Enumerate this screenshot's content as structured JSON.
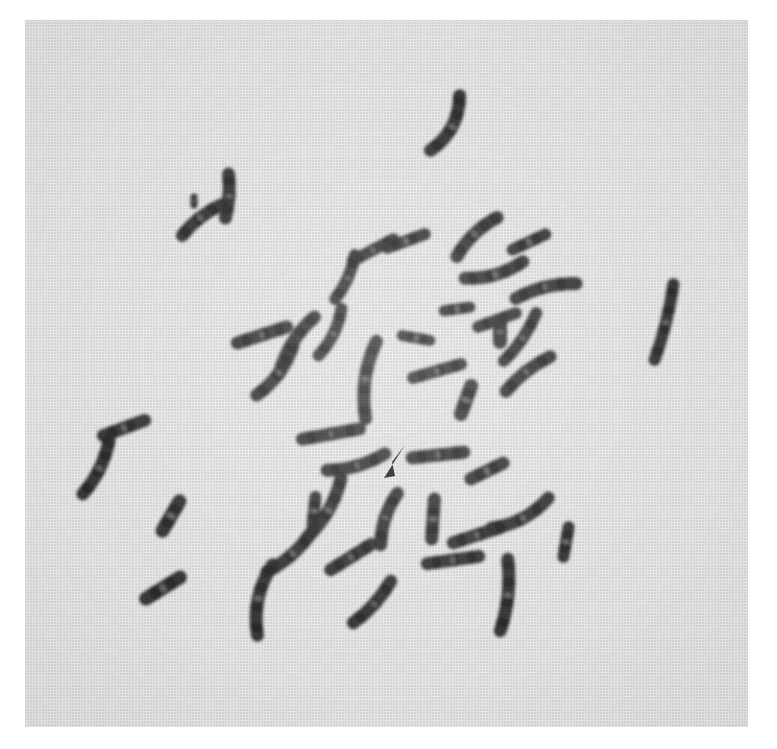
{
  "figure": {
    "kind": "photomicrograph",
    "caption_text": "",
    "plate_background_color": "#e4e4e4",
    "stain_color": "#1a1a1a",
    "page_background_color": "#ffffff",
    "has_visible_text": false,
    "plate": {
      "x": 25,
      "y": 20,
      "width": 723,
      "height": 707
    },
    "annotation": {
      "marker_type": "arrowhead",
      "marker_color": "#0d0d0d",
      "label": "",
      "points_toward": "up-right",
      "position": {
        "x": 383,
        "y": 444,
        "width": 24,
        "height": 36
      },
      "polygon": "405,445 384,478 395,476 392,462"
    },
    "chromosome_count_visible": 46,
    "chromosomes": [
      {
        "id": "c01",
        "cx": 445,
        "cy": 123,
        "len": 62,
        "w": 13,
        "rot": 28,
        "bend": 16,
        "bands": [
          0.12,
          0.42,
          0.7,
          0.92
        ]
      },
      {
        "id": "c02",
        "cx": 227,
        "cy": 196,
        "len": 44,
        "w": 13,
        "rot": 4,
        "bend": 4,
        "bands": [
          0.18,
          0.52,
          0.84
        ]
      },
      {
        "id": "c03",
        "cx": 202,
        "cy": 220,
        "len": 50,
        "w": 13,
        "rot": 52,
        "bend": -6,
        "bands": [
          0.1,
          0.45,
          0.8
        ]
      },
      {
        "id": "c04",
        "cx": 194,
        "cy": 201,
        "len": 8,
        "w": 7,
        "rot": 0,
        "bend": 0,
        "bands": [
          0.5
        ]
      },
      {
        "id": "c05",
        "cx": 477,
        "cy": 237,
        "len": 56,
        "w": 13,
        "rot": 46,
        "bend": -8,
        "bands": [
          0.12,
          0.44,
          0.74,
          0.94
        ]
      },
      {
        "id": "c06",
        "cx": 529,
        "cy": 242,
        "len": 36,
        "w": 12,
        "rot": 65,
        "bend": 0,
        "bands": [
          0.25,
          0.72
        ]
      },
      {
        "id": "c07",
        "cx": 373,
        "cy": 250,
        "len": 46,
        "w": 12,
        "rot": 62,
        "bend": 0,
        "bands": [
          0.16,
          0.52,
          0.86
        ]
      },
      {
        "id": "c08",
        "cx": 345,
        "cy": 277,
        "len": 48,
        "w": 12,
        "rot": 24,
        "bend": 6,
        "bands": [
          0.14,
          0.48,
          0.82
        ]
      },
      {
        "id": "c09",
        "cx": 406,
        "cy": 241,
        "len": 40,
        "w": 12,
        "rot": 70,
        "bend": 0,
        "bands": [
          0.22,
          0.68
        ]
      },
      {
        "id": "c10",
        "cx": 494,
        "cy": 270,
        "len": 60,
        "w": 13,
        "rot": 74,
        "bend": 10,
        "bands": [
          0.12,
          0.4,
          0.68,
          0.92
        ]
      },
      {
        "id": "c11",
        "cx": 546,
        "cy": 291,
        "len": 62,
        "w": 13,
        "rot": 76,
        "bend": -8,
        "bands": [
          0.14,
          0.46,
          0.76
        ]
      },
      {
        "id": "c12",
        "cx": 664,
        "cy": 322,
        "len": 78,
        "w": 12,
        "rot": 14,
        "bend": 4,
        "bands": [
          0.12,
          0.4,
          0.66,
          0.9
        ]
      },
      {
        "id": "c13",
        "cx": 262,
        "cy": 335,
        "len": 52,
        "w": 13,
        "rot": 72,
        "bend": 0,
        "bands": [
          0.18,
          0.55,
          0.86
        ]
      },
      {
        "id": "c14",
        "cx": 297,
        "cy": 345,
        "len": 66,
        "w": 13,
        "rot": 32,
        "bend": -10,
        "bands": [
          0.12,
          0.42,
          0.7,
          0.92
        ]
      },
      {
        "id": "c15",
        "cx": 330,
        "cy": 332,
        "len": 52,
        "w": 12,
        "rot": 26,
        "bend": 8,
        "bands": [
          0.16,
          0.52,
          0.84
        ]
      },
      {
        "id": "c16",
        "cx": 497,
        "cy": 320,
        "len": 40,
        "w": 12,
        "rot": 70,
        "bend": 0,
        "bands": [
          0.22,
          0.7
        ]
      },
      {
        "id": "c17",
        "cx": 457,
        "cy": 309,
        "len": 26,
        "w": 11,
        "rot": 82,
        "bend": 0,
        "bands": [
          0.3,
          0.76
        ]
      },
      {
        "id": "c18",
        "cx": 520,
        "cy": 337,
        "len": 58,
        "w": 12,
        "rot": 34,
        "bend": 6,
        "bands": [
          0.14,
          0.46,
          0.78
        ]
      },
      {
        "id": "c19",
        "cx": 275,
        "cy": 370,
        "len": 62,
        "w": 13,
        "rot": 36,
        "bend": 10,
        "bands": [
          0.12,
          0.44,
          0.74,
          0.94
        ]
      },
      {
        "id": "c20",
        "cx": 371,
        "cy": 380,
        "len": 78,
        "w": 13,
        "rot": 8,
        "bend": -12,
        "bands": [
          0.1,
          0.36,
          0.62,
          0.88
        ]
      },
      {
        "id": "c21",
        "cx": 437,
        "cy": 371,
        "len": 50,
        "w": 12,
        "rot": 74,
        "bend": 0,
        "bands": [
          0.18,
          0.56,
          0.88
        ]
      },
      {
        "id": "c22",
        "cx": 416,
        "cy": 338,
        "len": 28,
        "w": 11,
        "rot": 100,
        "bend": 0,
        "bands": [
          0.3,
          0.76
        ]
      },
      {
        "id": "c23",
        "cx": 466,
        "cy": 400,
        "len": 30,
        "w": 14,
        "rot": 20,
        "bend": 0,
        "bands": [
          0.3,
          0.74
        ]
      },
      {
        "id": "c24",
        "cx": 528,
        "cy": 374,
        "len": 56,
        "w": 13,
        "rot": 52,
        "bend": -6,
        "bands": [
          0.14,
          0.5,
          0.84
        ]
      },
      {
        "id": "c25",
        "cx": 500,
        "cy": 332,
        "len": 20,
        "w": 14,
        "rot": 0,
        "bend": 0,
        "bands": [
          0.5
        ]
      },
      {
        "id": "c26",
        "cx": 124,
        "cy": 428,
        "len": 44,
        "w": 13,
        "rot": 70,
        "bend": 0,
        "bands": [
          0.22,
          0.66
        ]
      },
      {
        "id": "c27",
        "cx": 96,
        "cy": 467,
        "len": 60,
        "w": 13,
        "rot": 26,
        "bend": 8,
        "bands": [
          0.12,
          0.44,
          0.74,
          0.94
        ]
      },
      {
        "id": "c28",
        "cx": 171,
        "cy": 516,
        "len": 34,
        "w": 14,
        "rot": 30,
        "bend": 0,
        "bands": [
          0.28,
          0.74
        ]
      },
      {
        "id": "c29",
        "cx": 163,
        "cy": 588,
        "len": 40,
        "w": 14,
        "rot": 58,
        "bend": 0,
        "bands": [
          0.26,
          0.72
        ]
      },
      {
        "id": "c30",
        "cx": 331,
        "cy": 434,
        "len": 58,
        "w": 13,
        "rot": 80,
        "bend": 0,
        "bands": [
          0.16,
          0.5,
          0.84
        ]
      },
      {
        "id": "c31",
        "cx": 356,
        "cy": 462,
        "len": 60,
        "w": 13,
        "rot": 74,
        "bend": 8,
        "bands": [
          0.14,
          0.48,
          0.8
        ]
      },
      {
        "id": "c32",
        "cx": 438,
        "cy": 455,
        "len": 52,
        "w": 13,
        "rot": 84,
        "bend": 0,
        "bands": [
          0.18,
          0.54,
          0.86
        ]
      },
      {
        "id": "c33",
        "cx": 487,
        "cy": 471,
        "len": 36,
        "w": 13,
        "rot": 64,
        "bend": 0,
        "bands": [
          0.26,
          0.72
        ]
      },
      {
        "id": "c34",
        "cx": 324,
        "cy": 508,
        "len": 68,
        "w": 13,
        "rot": 30,
        "bend": 10,
        "bands": [
          0.12,
          0.42,
          0.7,
          0.92
        ]
      },
      {
        "id": "c35",
        "cx": 389,
        "cy": 519,
        "len": 54,
        "w": 13,
        "rot": 18,
        "bend": -8,
        "bands": [
          0.16,
          0.5,
          0.84
        ]
      },
      {
        "id": "c36",
        "cx": 290,
        "cy": 551,
        "len": 62,
        "w": 13,
        "rot": 48,
        "bend": 8,
        "bands": [
          0.12,
          0.44,
          0.76
        ]
      },
      {
        "id": "c37",
        "cx": 351,
        "cy": 557,
        "len": 48,
        "w": 13,
        "rot": 58,
        "bend": 0,
        "bands": [
          0.2,
          0.58,
          0.88
        ]
      },
      {
        "id": "c38",
        "cx": 314,
        "cy": 511,
        "len": 28,
        "w": 12,
        "rot": 6,
        "bend": 0,
        "bands": [
          0.3,
          0.74
        ]
      },
      {
        "id": "c39",
        "cx": 265,
        "cy": 600,
        "len": 72,
        "w": 13,
        "rot": 12,
        "bend": -14,
        "bands": [
          0.1,
          0.38,
          0.66,
          0.92
        ]
      },
      {
        "id": "c40",
        "cx": 372,
        "cy": 602,
        "len": 56,
        "w": 13,
        "rot": 42,
        "bend": 6,
        "bands": [
          0.16,
          0.52,
          0.84
        ]
      },
      {
        "id": "c41",
        "cx": 433,
        "cy": 519,
        "len": 40,
        "w": 13,
        "rot": 4,
        "bend": 0,
        "bands": [
          0.22,
          0.68
        ]
      },
      {
        "id": "c42",
        "cx": 477,
        "cy": 535,
        "len": 50,
        "w": 13,
        "rot": 72,
        "bend": 0,
        "bands": [
          0.18,
          0.56,
          0.88
        ]
      },
      {
        "id": "c43",
        "cx": 453,
        "cy": 560,
        "len": 52,
        "w": 13,
        "rot": 82,
        "bend": 0,
        "bands": [
          0.18,
          0.54,
          0.86
        ]
      },
      {
        "id": "c44",
        "cx": 520,
        "cy": 513,
        "len": 64,
        "w": 13,
        "rot": 62,
        "bend": 12,
        "bands": [
          0.12,
          0.44,
          0.76
        ]
      },
      {
        "id": "c45",
        "cx": 504,
        "cy": 595,
        "len": 72,
        "w": 13,
        "rot": 6,
        "bend": 8,
        "bands": [
          0.12,
          0.4,
          0.68,
          0.92
        ]
      },
      {
        "id": "c46",
        "cx": 566,
        "cy": 542,
        "len": 30,
        "w": 12,
        "rot": 10,
        "bend": 0,
        "bands": [
          0.3,
          0.76
        ]
      }
    ]
  }
}
